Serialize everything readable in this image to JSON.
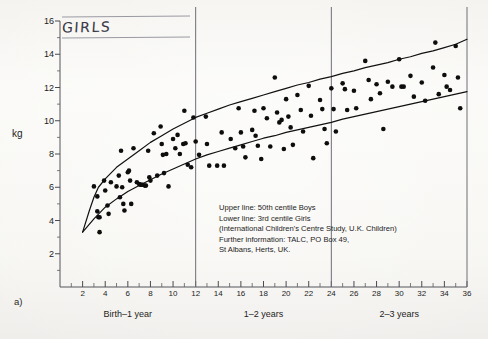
{
  "figure": {
    "panel_label": "a)",
    "handwritten_title": "GIRLS",
    "y_axis_title": "kg"
  },
  "annotation": {
    "lines": [
      "Upper line: 50th centile Boys",
      "Lower line: 3rd centile Girls",
      "(International Children's Centre Study, U.K. Children)",
      "Further information: TALC, PO Box 49,",
      "St Albans, Herts, UK."
    ]
  },
  "sections": [
    {
      "label": "Birth–1 year",
      "center_month": 6
    },
    {
      "label": "1–2 years",
      "center_month": 18
    },
    {
      "label": "2–3 years",
      "center_month": 30
    }
  ],
  "chart_data": {
    "type": "scatter",
    "title": "GIRLS",
    "xlabel": "Age (months)",
    "ylabel": "kg",
    "xlim": [
      0,
      36
    ],
    "ylim": [
      0,
      16
    ],
    "grid": false,
    "legend_position": "inset-lower-center",
    "x_major_ticks": [
      2,
      4,
      6,
      8,
      10,
      12,
      14,
      16,
      18,
      20,
      22,
      24,
      26,
      28,
      30,
      32,
      34,
      36
    ],
    "x_minor_ticks": [
      1,
      3,
      5,
      7,
      9,
      11,
      13,
      15,
      17,
      19,
      21,
      23,
      25,
      27,
      29,
      31,
      33,
      35
    ],
    "y_major_ticks": [
      2,
      4,
      6,
      8,
      10,
      12,
      14,
      16
    ],
    "y_minor_ticks": [
      1,
      3,
      5,
      7,
      9,
      11,
      13,
      15
    ],
    "dividers_at_months": [
      12,
      24,
      36
    ],
    "series": [
      {
        "name": "Upper line: 50th centile Boys",
        "type": "line",
        "points": [
          [
            2.0,
            3.3
          ],
          [
            2.6,
            4.6
          ],
          [
            3.0,
            5.4
          ],
          [
            3.4,
            6.0
          ],
          [
            4.0,
            6.5
          ],
          [
            5.0,
            7.2
          ],
          [
            6.0,
            7.7
          ],
          [
            7.0,
            8.2
          ],
          [
            8.0,
            8.7
          ],
          [
            9.0,
            9.1
          ],
          [
            10.0,
            9.5
          ],
          [
            11.0,
            9.85
          ],
          [
            12.0,
            10.2
          ],
          [
            13.0,
            10.45
          ],
          [
            14.0,
            10.7
          ],
          [
            15.0,
            10.95
          ],
          [
            16.0,
            11.15
          ],
          [
            17.0,
            11.35
          ],
          [
            18.0,
            11.55
          ],
          [
            19.0,
            11.75
          ],
          [
            20.0,
            11.95
          ],
          [
            21.0,
            12.15
          ],
          [
            22.0,
            12.3
          ],
          [
            23.0,
            12.5
          ],
          [
            24.0,
            12.65
          ],
          [
            25.0,
            12.85
          ],
          [
            26.0,
            13.0
          ],
          [
            27.0,
            13.2
          ],
          [
            28.0,
            13.35
          ],
          [
            29.0,
            13.5
          ],
          [
            30.0,
            13.7
          ],
          [
            31.0,
            13.85
          ],
          [
            32.0,
            14.05
          ],
          [
            33.0,
            14.2
          ],
          [
            34.0,
            14.4
          ],
          [
            35.0,
            14.6
          ],
          [
            36.0,
            14.9
          ]
        ]
      },
      {
        "name": "Lower line: 3rd centile Girls",
        "type": "line",
        "points": [
          [
            2.0,
            3.3
          ],
          [
            3.0,
            4.1
          ],
          [
            4.0,
            4.8
          ],
          [
            5.0,
            5.3
          ],
          [
            6.0,
            5.75
          ],
          [
            7.0,
            6.1
          ],
          [
            8.0,
            6.45
          ],
          [
            9.0,
            6.8
          ],
          [
            10.0,
            7.1
          ],
          [
            11.0,
            7.4
          ],
          [
            12.0,
            7.7
          ],
          [
            13.0,
            7.95
          ],
          [
            14.0,
            8.15
          ],
          [
            15.0,
            8.35
          ],
          [
            16.0,
            8.55
          ],
          [
            17.0,
            8.75
          ],
          [
            18.0,
            8.95
          ],
          [
            19.0,
            9.1
          ],
          [
            20.0,
            9.3
          ],
          [
            21.0,
            9.45
          ],
          [
            22.0,
            9.6
          ],
          [
            23.0,
            9.75
          ],
          [
            24.0,
            9.9
          ],
          [
            25.0,
            10.1
          ],
          [
            26.0,
            10.25
          ],
          [
            27.0,
            10.4
          ],
          [
            28.0,
            10.55
          ],
          [
            29.0,
            10.7
          ],
          [
            30.0,
            10.85
          ],
          [
            31.0,
            11.0
          ],
          [
            32.0,
            11.15
          ],
          [
            33.0,
            11.3
          ],
          [
            34.0,
            11.45
          ],
          [
            35.0,
            11.6
          ],
          [
            36.0,
            11.75
          ]
        ]
      },
      {
        "name": "Individual children weights",
        "type": "scatter",
        "marker": "filled-circle",
        "points": [
          [
            3.0,
            6.05
          ],
          [
            3.3,
            5.45
          ],
          [
            3.3,
            4.55
          ],
          [
            3.4,
            4.2
          ],
          [
            3.5,
            4.2
          ],
          [
            3.5,
            3.3
          ],
          [
            3.9,
            6.4
          ],
          [
            4.0,
            5.8
          ],
          [
            4.2,
            4.9
          ],
          [
            4.3,
            4.4
          ],
          [
            4.5,
            6.3
          ],
          [
            5.0,
            6.05
          ],
          [
            5.2,
            6.7
          ],
          [
            5.3,
            5.4
          ],
          [
            5.4,
            8.2
          ],
          [
            5.5,
            6.0
          ],
          [
            5.6,
            5.0
          ],
          [
            5.7,
            4.6
          ],
          [
            6.0,
            6.9
          ],
          [
            6.1,
            7.0
          ],
          [
            6.2,
            6.4
          ],
          [
            6.3,
            5.0
          ],
          [
            6.5,
            8.35
          ],
          [
            6.8,
            6.3
          ],
          [
            7.0,
            6.2
          ],
          [
            7.1,
            6.15
          ],
          [
            7.2,
            6.15
          ],
          [
            7.3,
            6.15
          ],
          [
            7.5,
            6.1
          ],
          [
            7.6,
            6.1
          ],
          [
            7.8,
            8.2
          ],
          [
            7.9,
            6.6
          ],
          [
            8.0,
            6.4
          ],
          [
            8.3,
            9.25
          ],
          [
            8.6,
            6.7
          ],
          [
            8.9,
            9.65
          ],
          [
            9.0,
            8.6
          ],
          [
            9.1,
            7.95
          ],
          [
            9.2,
            6.85
          ],
          [
            9.4,
            8.0
          ],
          [
            9.6,
            6.05
          ],
          [
            10.0,
            8.9
          ],
          [
            10.2,
            8.35
          ],
          [
            10.4,
            9.15
          ],
          [
            10.6,
            8.0
          ],
          [
            10.9,
            8.6
          ],
          [
            11.0,
            10.6
          ],
          [
            11.1,
            8.65
          ],
          [
            11.3,
            7.35
          ],
          [
            11.6,
            7.2
          ],
          [
            11.8,
            10.2
          ],
          [
            12.0,
            8.75
          ],
          [
            12.3,
            7.95
          ],
          [
            12.9,
            10.25
          ],
          [
            13.0,
            8.6
          ],
          [
            13.2,
            7.3
          ],
          [
            13.9,
            7.3
          ],
          [
            14.3,
            9.3
          ],
          [
            14.5,
            7.3
          ],
          [
            15.1,
            8.9
          ],
          [
            15.5,
            8.35
          ],
          [
            15.8,
            10.75
          ],
          [
            16.0,
            9.3
          ],
          [
            16.2,
            8.45
          ],
          [
            16.4,
            7.8
          ],
          [
            17.0,
            9.45
          ],
          [
            17.2,
            10.6
          ],
          [
            17.3,
            9.1
          ],
          [
            17.5,
            8.5
          ],
          [
            17.8,
            7.7
          ],
          [
            18.0,
            10.75
          ],
          [
            18.3,
            10.15
          ],
          [
            18.6,
            8.45
          ],
          [
            19.0,
            12.6
          ],
          [
            19.2,
            10.5
          ],
          [
            19.4,
            9.9
          ],
          [
            19.6,
            10.05
          ],
          [
            19.8,
            8.3
          ],
          [
            20.0,
            11.3
          ],
          [
            20.2,
            10.25
          ],
          [
            20.4,
            9.6
          ],
          [
            20.6,
            8.55
          ],
          [
            21.0,
            11.55
          ],
          [
            21.3,
            10.65
          ],
          [
            21.5,
            9.35
          ],
          [
            22.0,
            12.1
          ],
          [
            22.2,
            10.3
          ],
          [
            22.4,
            7.75
          ],
          [
            23.0,
            11.25
          ],
          [
            23.2,
            10.7
          ],
          [
            23.4,
            9.5
          ],
          [
            23.6,
            8.65
          ],
          [
            24.0,
            11.95
          ],
          [
            24.2,
            10.7
          ],
          [
            24.4,
            9.35
          ],
          [
            25.0,
            12.25
          ],
          [
            25.2,
            11.9
          ],
          [
            25.4,
            10.65
          ],
          [
            26.0,
            11.8
          ],
          [
            26.2,
            10.75
          ],
          [
            27.0,
            13.6
          ],
          [
            27.3,
            12.45
          ],
          [
            27.5,
            11.3
          ],
          [
            28.0,
            12.2
          ],
          [
            28.3,
            11.65
          ],
          [
            28.6,
            9.5
          ],
          [
            29.0,
            12.35
          ],
          [
            29.4,
            12.05
          ],
          [
            30.0,
            13.7
          ],
          [
            30.2,
            12.05
          ],
          [
            30.4,
            12.05
          ],
          [
            31.0,
            12.7
          ],
          [
            31.3,
            11.45
          ],
          [
            32.0,
            12.3
          ],
          [
            32.3,
            11.2
          ],
          [
            33.0,
            13.2
          ],
          [
            33.2,
            14.7
          ],
          [
            33.5,
            11.6
          ],
          [
            34.0,
            12.75
          ],
          [
            34.2,
            12.05
          ],
          [
            34.5,
            11.85
          ],
          [
            35.0,
            14.5
          ],
          [
            35.2,
            12.6
          ],
          [
            35.4,
            10.75
          ]
        ]
      }
    ]
  }
}
